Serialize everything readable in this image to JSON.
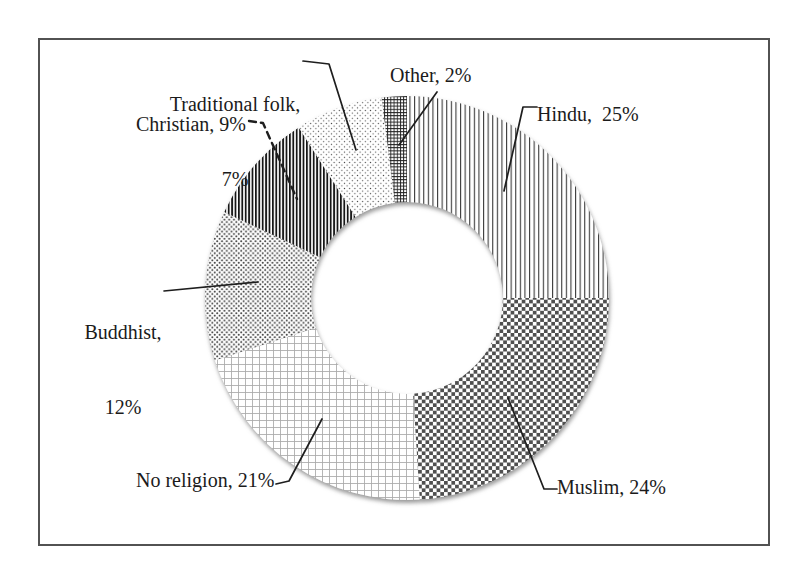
{
  "figure": {
    "background_color": "#ffffff",
    "frame_color": "#525252",
    "ink_color": "#1b1b1b"
  },
  "chart_data": {
    "type": "donut",
    "title": "",
    "unit": "%",
    "direction": "clockwise",
    "start_angle_deg": 0,
    "inner_radius_ratio": 0.475,
    "legend": "none",
    "grid": false,
    "categories": [
      "Hindu",
      "Muslim",
      "No religion",
      "Buddhist",
      "Christian",
      "Traditional folk",
      "Other"
    ],
    "values": [
      25,
      24,
      21,
      12,
      9,
      7,
      2
    ],
    "segments": [
      {
        "name": "Hindu",
        "value": 25,
        "pattern": "thin-vertical-lines",
        "label": "Hindu,  25%"
      },
      {
        "name": "Muslim",
        "value": 24,
        "pattern": "checkerboard",
        "label": "Muslim, 24%"
      },
      {
        "name": "No religion",
        "value": 21,
        "pattern": "light-grid",
        "label": "No religion, 21%"
      },
      {
        "name": "Buddhist",
        "value": 12,
        "pattern": "dense-dots",
        "label": "Buddhist, 12%",
        "label_lines": [
          "Buddhist,",
          "12%"
        ]
      },
      {
        "name": "Christian",
        "value": 9,
        "pattern": "dark-vertical-lines",
        "label": "Christian, 9%"
      },
      {
        "name": "Traditional folk",
        "value": 7,
        "pattern": "sparse-dots",
        "label": "Traditional folk, 7%",
        "label_lines": [
          "Traditional folk,",
          "7%"
        ]
      },
      {
        "name": "Other",
        "value": 2,
        "pattern": "fine-crosshatch",
        "label": "Other, 2%"
      }
    ]
  }
}
